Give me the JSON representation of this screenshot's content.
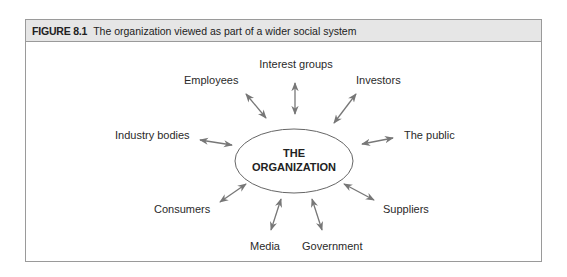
{
  "figure": {
    "number": "FIGURE 8.1",
    "caption": "The organization viewed as part of a wider social system"
  },
  "diagram": {
    "center": {
      "line1": "THE",
      "line2": "ORGANIZATION"
    },
    "nodes": [
      {
        "id": "interest-groups",
        "label": "Interest groups"
      },
      {
        "id": "investors",
        "label": "Investors"
      },
      {
        "id": "the-public",
        "label": "The public"
      },
      {
        "id": "suppliers",
        "label": "Suppliers"
      },
      {
        "id": "government",
        "label": "Government"
      },
      {
        "id": "media",
        "label": "Media"
      },
      {
        "id": "consumers",
        "label": "Consumers"
      },
      {
        "id": "industry-bodies",
        "label": "Industry bodies"
      },
      {
        "id": "employees",
        "label": "Employees"
      }
    ],
    "colors": {
      "arrow": "#777777",
      "ellipse": "#666666",
      "header_bg": "#e6e6e6",
      "border": "#9a9a9a"
    }
  }
}
